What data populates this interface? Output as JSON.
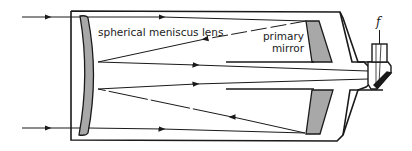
{
  "diagram": {
    "type": "optical-ray-diagram",
    "labels": {
      "lens": "spherical meniscus lens",
      "mirror_line1": "primary",
      "mirror_line2": "mirror",
      "focus": "f"
    },
    "colors": {
      "stroke": "#1a1a1a",
      "optic_fill": "#a8a8a8",
      "background": "#ffffff",
      "text": "#222222"
    }
  }
}
